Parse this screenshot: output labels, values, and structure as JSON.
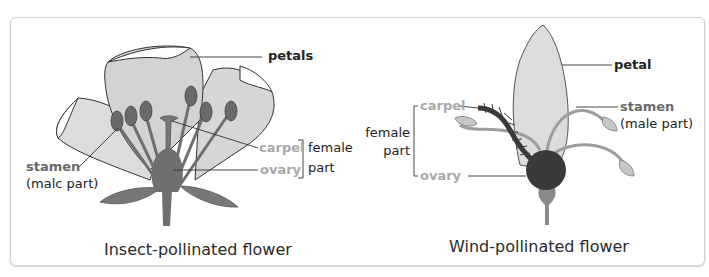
{
  "diagrams": [
    {
      "caption": "Insect-pollinated flower",
      "labels": {
        "petals": "petals",
        "stamen": "stamen",
        "stamen_note": "(malc part)",
        "carpel": "carpel",
        "ovary": "ovary",
        "female_1": "female",
        "female_2": "part"
      }
    },
    {
      "caption": "Wind-pollinated flower",
      "labels": {
        "petal": "petal",
        "stamen": "stamen",
        "stamen_note": "(male part)",
        "carpel": "carpel",
        "ovary": "ovary",
        "female_1": "female",
        "female_2": "part"
      }
    }
  ],
  "colors": {
    "petal_fill": "#d9d9d9",
    "organ_fill": "#6f6f6f",
    "ovary_dark": "#3a3a3a",
    "label_grey": "#a9a9a9",
    "label_dark": "#222222",
    "border": "#cfcfcf"
  }
}
